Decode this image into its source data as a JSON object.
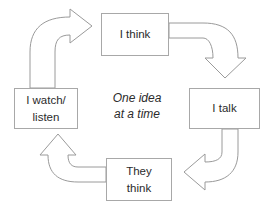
{
  "diagram": {
    "type": "cycle",
    "direction": "clockwise",
    "background_color": "#ffffff",
    "box_border_color": "#a8a8a8",
    "arrow_outline_color": "#9a9a9a",
    "text_color": "#2b2b2b",
    "center_caption": {
      "line1": "One idea",
      "line2": "at a time",
      "style": "italic"
    },
    "nodes": [
      {
        "id": "think",
        "position": "top",
        "line1": "I think",
        "line2": ""
      },
      {
        "id": "talk",
        "position": "right",
        "line1": "I talk",
        "line2": ""
      },
      {
        "id": "they-think",
        "position": "bottom",
        "line1": "They",
        "line2": "think"
      },
      {
        "id": "watch-listen",
        "position": "left",
        "line1": "I watch/",
        "line2": "listen"
      }
    ],
    "arrows": [
      {
        "id": "watch-to-think",
        "from": "watch-listen",
        "to": "think"
      },
      {
        "id": "think-to-talk",
        "from": "think",
        "to": "talk"
      },
      {
        "id": "talk-to-they-think",
        "from": "talk",
        "to": "they-think"
      },
      {
        "id": "they-think-to-watch",
        "from": "they-think",
        "to": "watch-listen"
      }
    ]
  }
}
